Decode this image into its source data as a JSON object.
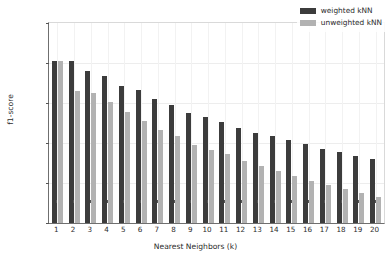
{
  "chart_data": {
    "type": "bar",
    "title": "",
    "xlabel": "Nearest Neighbors (k)",
    "ylabel": "f1-score",
    "categories": [
      "1",
      "2",
      "3",
      "4",
      "5",
      "6",
      "7",
      "8",
      "9",
      "10",
      "11",
      "12",
      "13",
      "14",
      "15",
      "16",
      "17",
      "18",
      "19",
      "20"
    ],
    "series": [
      {
        "name": "weighted kNN",
        "color": "#3c3c3c",
        "values": [
          0.902,
          0.902,
          0.89,
          0.884,
          0.871,
          0.866,
          0.855,
          0.848,
          0.838,
          0.833,
          0.826,
          0.819,
          0.813,
          0.809,
          0.804,
          0.799,
          0.793,
          0.789,
          0.784,
          0.78
        ]
      },
      {
        "name": "unweighted kNN",
        "color": "#b2b2b2",
        "values": [
          0.902,
          0.865,
          0.863,
          0.851,
          0.839,
          0.827,
          0.816,
          0.809,
          0.798,
          0.791,
          0.786,
          0.778,
          0.771,
          0.765,
          0.759,
          0.752,
          0.748,
          0.743,
          0.738,
          0.732
        ]
      }
    ],
    "ylim": [
      0.7,
      0.95
    ],
    "yticks": [
      "0.70",
      "0.75",
      "0.80",
      "0.85",
      "0.90",
      "0.95"
    ],
    "ytick_values": [
      0.7,
      0.75,
      0.8,
      0.85,
      0.9,
      0.95
    ],
    "grid": true,
    "legend_position": "upper right"
  },
  "legend": {
    "items": [
      {
        "label": "weighted kNN"
      },
      {
        "label": "unweighted kNN"
      }
    ]
  }
}
